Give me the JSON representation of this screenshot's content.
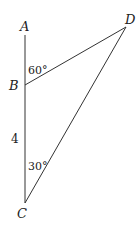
{
  "diagram": {
    "type": "geometry-triangle",
    "points": {
      "A": {
        "label": "A",
        "x": 25,
        "y": 35
      },
      "B": {
        "label": "B",
        "x": 25,
        "y": 85
      },
      "C": {
        "label": "C",
        "x": 25,
        "y": 203
      },
      "D": {
        "label": "D",
        "x": 126,
        "y": 27
      }
    },
    "angles": {
      "ABD": "60°",
      "BCD": "30°"
    },
    "lengths": {
      "BC": "4"
    },
    "stroke_color": "#333333"
  }
}
